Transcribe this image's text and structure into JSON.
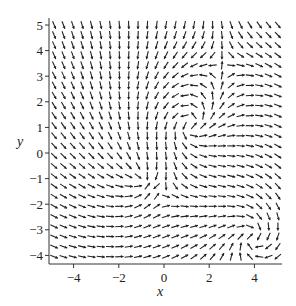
{
  "chart_data": {
    "type": "vector-field",
    "title": "",
    "xlabel": "x",
    "ylabel": "y",
    "xlim": [
      -5,
      5
    ],
    "ylim": [
      -4.2,
      5.1
    ],
    "xticks": [
      -4,
      -2,
      0,
      2,
      4
    ],
    "yticks": [
      -4,
      -3,
      -2,
      -1,
      0,
      1,
      2,
      3,
      4,
      5
    ],
    "grid": false,
    "legend": null,
    "grid_samples": {
      "nx": 25,
      "ny": 24
    },
    "features": [
      {
        "kind": "outward spiral / source",
        "x": 1.0,
        "y": 1.0
      },
      {
        "kind": "converging point",
        "x": -1.0,
        "y": -1.0
      },
      {
        "kind": "inward spiral",
        "x": 3.8,
        "y": -3.2
      }
    ],
    "arrow_color": "#222222",
    "axis_color": "#333333"
  },
  "axes": {
    "x_label": "x",
    "y_label": "y",
    "x_tick_labels": [
      "-4",
      "-2",
      "0",
      "2",
      "4"
    ],
    "y_tick_labels": [
      "-4",
      "-3",
      "-2",
      "-1",
      "0",
      "1",
      "2",
      "3",
      "4",
      "5"
    ]
  }
}
